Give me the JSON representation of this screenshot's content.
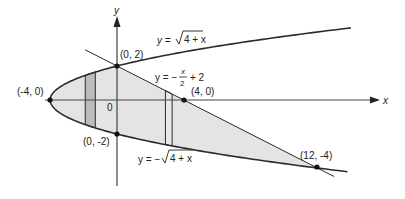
{
  "diagram": {
    "type": "region-between-curves",
    "axes": {
      "x_label": "x",
      "y_label": "y",
      "origin_label": "0"
    },
    "points": [
      {
        "label": "(0, 2)",
        "x": 0,
        "y": 2
      },
      {
        "label": "(-4, 0)",
        "x": -4,
        "y": 0
      },
      {
        "label": "(4, 0)",
        "x": 4,
        "y": 0
      },
      {
        "label": "(0, -2)",
        "x": 0,
        "y": -2
      },
      {
        "label": "(12, -4)",
        "x": 12,
        "y": -4
      }
    ],
    "curves": [
      {
        "name": "upper-parabola",
        "equation": "y = √(4 + x)",
        "display": {
          "lhs": "y = ",
          "rad": "4 + x"
        }
      },
      {
        "name": "lower-parabola",
        "equation": "y = −√(4 + x)",
        "display": {
          "lhs": "y = −",
          "rad": "4 + x"
        }
      },
      {
        "name": "line",
        "equation": "y = −x/2 + 2",
        "display": {
          "lhs": "y = −",
          "num": "x",
          "den": "2",
          "rhs": "+ 2"
        }
      }
    ],
    "strips": [
      {
        "name": "strip-left",
        "x_from": -1.9,
        "x_to": -1.3,
        "shade": "#bdbdbd"
      },
      {
        "name": "strip-right",
        "x_from": 2.9,
        "x_to": 3.3,
        "shade": "#e6e6e6"
      }
    ],
    "colors": {
      "region_fill": "#e4e4e4",
      "left_strip_fill": "#bcbcbc",
      "stroke": "#2a2a2a"
    }
  }
}
